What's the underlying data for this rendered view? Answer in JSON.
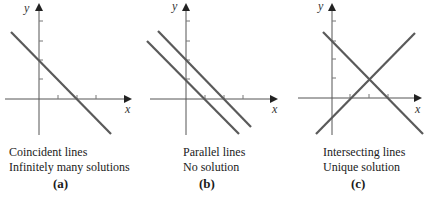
{
  "figure": {
    "panels": [
      {
        "id": "a",
        "label": "(a)",
        "caption_line1": "Coincident lines",
        "caption_line2": "Infinitely many solutions",
        "axis_x_label": "x",
        "axis_y_label": "y",
        "lines": [
          {
            "x1": 11,
            "y1": 32,
            "x2": 111,
            "y2": 134
          }
        ]
      },
      {
        "id": "b",
        "label": "(b)",
        "caption_line1": "Parallel lines",
        "caption_line2": "No solution",
        "axis_x_label": "x",
        "axis_y_label": "y",
        "lines": [
          {
            "x1": 158,
            "y1": 31,
            "x2": 251,
            "y2": 127
          },
          {
            "x1": 147,
            "y1": 41,
            "x2": 239,
            "y2": 134
          }
        ]
      },
      {
        "id": "c",
        "label": "(c)",
        "caption_line1": "Intersecting lines",
        "caption_line2": "Unique solution",
        "axis_x_label": "x",
        "axis_y_label": "y",
        "lines": [
          {
            "x1": 323,
            "y1": 32,
            "x2": 423,
            "y2": 134
          },
          {
            "x1": 316,
            "y1": 134,
            "x2": 415,
            "y2": 33
          }
        ]
      }
    ],
    "colors": {
      "line": "#5a5a5a",
      "axis": "#444444",
      "text": "#1a1a1a"
    }
  }
}
